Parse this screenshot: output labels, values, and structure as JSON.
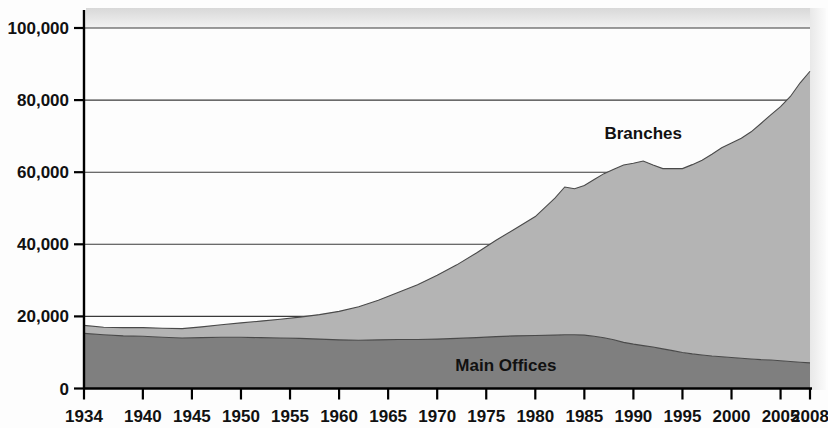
{
  "chart_data": {
    "type": "area",
    "title": "",
    "subtitle": "",
    "xlabel": "",
    "ylabel": "",
    "stacked": true,
    "grid": true,
    "legend_position": "inline-annotations",
    "xlim": [
      1934,
      2008
    ],
    "ylim": [
      0,
      100000
    ],
    "y_ticks": [
      0,
      20000,
      40000,
      60000,
      80000,
      100000
    ],
    "y_tick_labels": [
      "0",
      "20,000",
      "40,000",
      "60,000",
      "80,000",
      "100,000"
    ],
    "x_ticks": [
      1934,
      1940,
      1945,
      1950,
      1955,
      1960,
      1965,
      1970,
      1975,
      1980,
      1985,
      1990,
      1995,
      2000,
      2005,
      2008
    ],
    "x_tick_labels": [
      "1934",
      "1940",
      "1945",
      "1950",
      "1955",
      "1960",
      "1965",
      "1970",
      "1975",
      "1980",
      "1985",
      "1990",
      "1995",
      "2000",
      "2005",
      "2008"
    ],
    "annotations": [
      {
        "text": "Branches",
        "x": 1991,
        "y": 71000
      },
      {
        "text": "Main Offices",
        "x": 1977,
        "y": 6500
      }
    ],
    "colors": {
      "branches": "#b4b4b4",
      "main_offices": "#7f7f7f",
      "gridline": "#3a3a3a",
      "axis": "#000000",
      "text": "#111111",
      "background": "#fdfdfd"
    },
    "x": [
      1934,
      1936,
      1938,
      1940,
      1942,
      1944,
      1946,
      1948,
      1950,
      1952,
      1954,
      1956,
      1958,
      1960,
      1962,
      1964,
      1966,
      1968,
      1970,
      1972,
      1974,
      1976,
      1978,
      1980,
      1982,
      1983,
      1984,
      1985,
      1986,
      1987,
      1988,
      1989,
      1990,
      1991,
      1992,
      1993,
      1994,
      1995,
      1996,
      1997,
      1998,
      1999,
      2000,
      2001,
      2002,
      2003,
      2004,
      2005,
      2006,
      2007,
      2008
    ],
    "series": [
      {
        "name": "Main Offices",
        "color": "#7f7f7f",
        "values": [
          15300,
          14900,
          14600,
          14500,
          14200,
          14000,
          14100,
          14200,
          14200,
          14100,
          14000,
          13900,
          13700,
          13500,
          13400,
          13500,
          13600,
          13600,
          13700,
          13900,
          14100,
          14400,
          14600,
          14700,
          14800,
          14900,
          14900,
          14800,
          14500,
          14100,
          13500,
          12800,
          12300,
          11900,
          11500,
          11000,
          10500,
          10000,
          9600,
          9300,
          9000,
          8800,
          8600,
          8400,
          8200,
          8000,
          7900,
          7700,
          7500,
          7300,
          7100
        ],
        "note": "Dark gray lower band of the stacked area"
      },
      {
        "name": "Branches",
        "color": "#b4b4b4",
        "values": [
          2200,
          2100,
          2300,
          2400,
          2500,
          2600,
          3000,
          3500,
          4000,
          4600,
          5200,
          5900,
          6800,
          7900,
          9300,
          11000,
          13000,
          15200,
          17700,
          20400,
          23500,
          26700,
          29800,
          33000,
          38000,
          41000,
          40500,
          41500,
          43500,
          45500,
          47300,
          49200,
          50200,
          51200,
          50500,
          50000,
          50500,
          51000,
          52500,
          54000,
          56000,
          58000,
          59500,
          61000,
          63000,
          65500,
          68000,
          70500,
          73500,
          77500,
          80900
        ],
        "note": "Light gray upper band of the stacked area (above Main Offices)"
      }
    ],
    "totals": [
      17500,
      17000,
      16900,
      16900,
      16700,
      16600,
      17100,
      17700,
      18200,
      18700,
      19200,
      19800,
      20500,
      21400,
      22700,
      24500,
      26600,
      28800,
      31400,
      34300,
      37600,
      41100,
      44400,
      47700,
      52800,
      55900,
      55400,
      56300,
      58000,
      59600,
      60800,
      62000,
      62500,
      63100,
      62000,
      61000,
      61000,
      61000,
      62100,
      63300,
      65000,
      66800,
      68100,
      69400,
      71200,
      73500,
      75900,
      78200,
      81000,
      84800,
      88000
    ]
  }
}
